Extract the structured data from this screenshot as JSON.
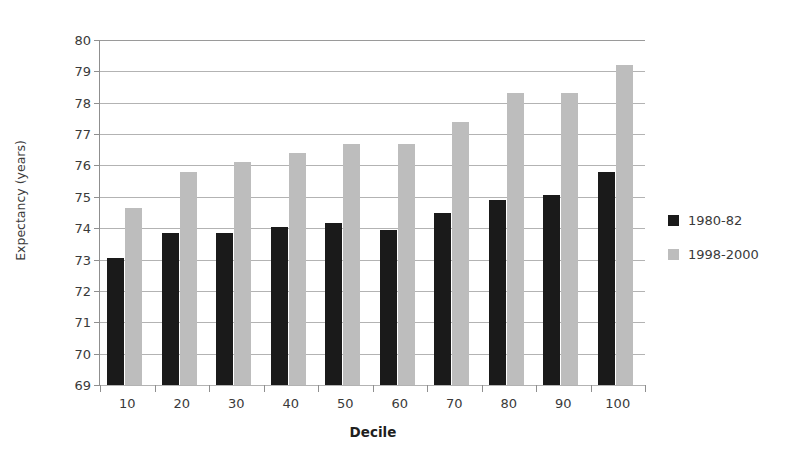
{
  "chart_data": {
    "type": "bar",
    "title": "",
    "xlabel": "Decile",
    "ylabel": "Expectancy (years)",
    "categories": [
      "10",
      "20",
      "30",
      "40",
      "50",
      "60",
      "70",
      "80",
      "90",
      "100"
    ],
    "series": [
      {
        "name": "1980-82",
        "color": "#1a1a1a",
        "values": [
          73.05,
          73.85,
          73.85,
          74.05,
          74.15,
          73.95,
          74.5,
          74.9,
          75.05,
          75.8
        ]
      },
      {
        "name": "1998-2000",
        "color": "#bdbdbd",
        "values": [
          74.65,
          75.8,
          76.1,
          76.4,
          76.7,
          76.7,
          77.4,
          78.3,
          78.3,
          79.2
        ]
      }
    ],
    "ylim": [
      69,
      80
    ],
    "yticks": [
      "69",
      "70",
      "71",
      "72",
      "73",
      "74",
      "75",
      "76",
      "77",
      "78",
      "79",
      "80"
    ],
    "grid": true,
    "legend_position": "right",
    "gridline_color": "#b3b3b3",
    "axis_color": "#8f8f8f",
    "background": "#ffffff"
  }
}
